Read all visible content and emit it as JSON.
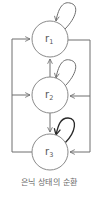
{
  "diagram": {
    "nodes": [
      {
        "id": "r1",
        "base": "r",
        "sub": "1"
      },
      {
        "id": "r2",
        "base": "r",
        "sub": "2"
      },
      {
        "id": "r3",
        "base": "r",
        "sub": "3"
      }
    ],
    "edges": [
      {
        "from": "r1",
        "to": "r1",
        "type": "self-loop"
      },
      {
        "from": "r2",
        "to": "r2",
        "type": "self-loop"
      },
      {
        "from": "r3",
        "to": "r3",
        "type": "self-loop"
      },
      {
        "from": "r2",
        "to": "r1"
      },
      {
        "from": "r2",
        "to": "r3"
      },
      {
        "from": "r3",
        "to": "r1",
        "route": "left"
      },
      {
        "from": "r3",
        "to": "r2",
        "route": "left"
      },
      {
        "from": "r1",
        "to": "r2",
        "route": "right"
      },
      {
        "from": "r1",
        "to": "r3",
        "route": "right"
      }
    ],
    "caption": "은닉 상태의 순환",
    "colors": {
      "node_stroke": "#8a8a8a",
      "edge": "#6e6e6e",
      "edge_dark": "#2a2a2a",
      "text": "#555555"
    }
  }
}
